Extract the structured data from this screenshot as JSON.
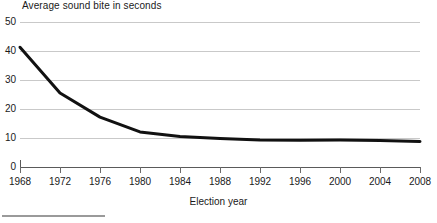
{
  "chart_data": {
    "type": "line",
    "title": "Average sound bite in seconds",
    "xlabel": "Election year",
    "ylabel": "",
    "x": [
      1968,
      1972,
      1976,
      1980,
      1984,
      1988,
      1992,
      1996,
      2000,
      2004,
      2008
    ],
    "values": [
      41.3,
      25.5,
      17.2,
      12.1,
      10.5,
      9.8,
      9.3,
      9.2,
      9.3,
      9.1,
      8.8
    ],
    "categories": [
      "1968",
      "1972",
      "1976",
      "1980",
      "1984",
      "1988",
      "1992",
      "1996",
      "2000",
      "2004",
      "2008"
    ],
    "xlim": [
      1968,
      2008
    ],
    "ylim": [
      0,
      50
    ],
    "yticks": [
      0,
      10,
      20,
      30,
      40,
      50
    ],
    "ytick_labels": [
      "0",
      "10",
      "20",
      "30",
      "40",
      "50"
    ],
    "xticks": [
      1968,
      1972,
      1976,
      1980,
      1984,
      1988,
      1992,
      1996,
      2000,
      2004,
      2008
    ],
    "xtick_labels": [
      "1968",
      "1972",
      "1976",
      "1980",
      "1984",
      "1988",
      "1992",
      "1996",
      "2000",
      "2004",
      "2008"
    ],
    "grid": "horizontal",
    "legend": "none",
    "series": [
      {
        "name": "Average sound bite in seconds",
        "color": "#111111",
        "line_width": 3,
        "markers": "none",
        "values": [
          41.3,
          25.5,
          17.2,
          12.1,
          10.5,
          9.8,
          9.3,
          9.2,
          9.3,
          9.1,
          8.8
        ]
      }
    ],
    "colors": {
      "line": "#111111",
      "grid": "#c9c9c9",
      "axis": "#5a5a5a",
      "text": "#1a1a1a",
      "background": "#ffffff",
      "rule": "#9a9a9a"
    }
  },
  "figure": {
    "title": "Average sound bite in seconds",
    "xaxis_title": "Election year"
  }
}
